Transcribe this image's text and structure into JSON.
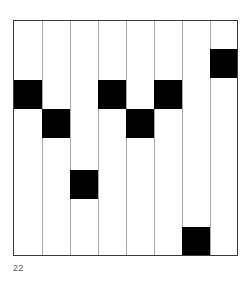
{
  "figure": {
    "caption": "22",
    "background_color": "#ffffff",
    "frame_color": "#3a3a3a",
    "divider_color": "#a9a9a9",
    "block_color": "#000000",
    "caption_color": "#5a5a5a"
  },
  "chart_data": {
    "type": "heatmap",
    "title": "",
    "subtitle": "",
    "xlabel": "",
    "ylabel": "",
    "grid": true,
    "legend": null,
    "columns": 8,
    "rows": 8,
    "x": [
      1,
      2,
      3,
      4,
      5,
      6,
      7,
      8
    ],
    "categories": [
      "1",
      "2",
      "3",
      "4",
      "5",
      "6",
      "7",
      "8"
    ],
    "values": [
      3,
      4,
      6,
      3,
      4,
      3,
      8,
      2
    ],
    "xlim": [
      0,
      8
    ],
    "ylim": [
      0,
      8
    ],
    "cells": [
      {
        "column": 1,
        "row": 3,
        "x_px": 0,
        "y_px": 59,
        "w_px": 28,
        "h_px": 29,
        "filled": true
      },
      {
        "column": 2,
        "row": 4,
        "x_px": 28,
        "y_px": 88,
        "w_px": 28,
        "h_px": 29,
        "filled": true
      },
      {
        "column": 3,
        "row": 6,
        "x_px": 56,
        "y_px": 149,
        "w_px": 28,
        "h_px": 29,
        "filled": true
      },
      {
        "column": 4,
        "row": 3,
        "x_px": 84,
        "y_px": 59,
        "w_px": 28,
        "h_px": 29,
        "filled": true
      },
      {
        "column": 5,
        "row": 4,
        "x_px": 112,
        "y_px": 88,
        "w_px": 28,
        "h_px": 29,
        "filled": true
      },
      {
        "column": 6,
        "row": 3,
        "x_px": 140,
        "y_px": 59,
        "w_px": 28,
        "h_px": 29,
        "filled": true
      },
      {
        "column": 7,
        "row": 8,
        "x_px": 168,
        "y_px": 206,
        "w_px": 28,
        "h_px": 28,
        "filled": true
      },
      {
        "column": 8,
        "row": 2,
        "x_px": 196,
        "y_px": 28,
        "w_px": 27,
        "h_px": 29,
        "filled": true
      }
    ],
    "dividers_px": [
      28,
      56,
      84,
      112,
      140,
      168,
      196
    ]
  }
}
